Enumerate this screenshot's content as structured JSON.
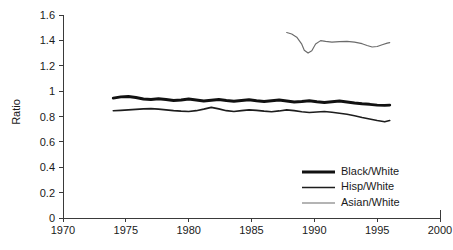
{
  "chart_data": {
    "type": "line",
    "title": "",
    "xlabel": "",
    "ylabel": "Ratio",
    "xlim": [
      1970,
      2000
    ],
    "ylim": [
      0,
      1.6
    ],
    "grid": false,
    "legend_position": "bottom-right",
    "x_ticks": [
      "1970",
      "1975",
      "1980",
      "1985",
      "1990",
      "1995",
      "2000"
    ],
    "y_ticks": [
      "0",
      "0.2",
      "0.4",
      "0.6",
      "0.8",
      "1",
      "1.2",
      "1.4",
      "1.6"
    ],
    "series": [
      {
        "name": "Black/White",
        "color": "#111111",
        "width": 2.9,
        "x": [
          1974.0,
          1974.6,
          1975.2,
          1975.8,
          1976.4,
          1977.0,
          1977.6,
          1978.2,
          1978.8,
          1979.4,
          1980.0,
          1980.6,
          1981.2,
          1981.8,
          1982.4,
          1983.0,
          1983.6,
          1984.2,
          1984.8,
          1985.4,
          1986.0,
          1986.6,
          1987.2,
          1987.8,
          1988.4,
          1989.0,
          1989.6,
          1990.2,
          1990.8,
          1991.4,
          1992.0,
          1992.6,
          1993.2,
          1993.8,
          1994.4,
          1995.0,
          1995.6,
          1996.0
        ],
        "values": [
          0.945,
          0.955,
          0.958,
          0.95,
          0.938,
          0.934,
          0.94,
          0.934,
          0.926,
          0.93,
          0.938,
          0.93,
          0.922,
          0.928,
          0.934,
          0.926,
          0.92,
          0.926,
          0.932,
          0.924,
          0.918,
          0.924,
          0.93,
          0.922,
          0.914,
          0.918,
          0.924,
          0.916,
          0.91,
          0.916,
          0.922,
          0.914,
          0.906,
          0.9,
          0.896,
          0.89,
          0.888,
          0.89
        ]
      },
      {
        "name": "Hisp/White",
        "color": "#1d1d1d",
        "width": 1.6,
        "x": [
          1974.0,
          1974.6,
          1975.2,
          1975.8,
          1976.4,
          1977.0,
          1977.6,
          1978.2,
          1978.8,
          1979.4,
          1980.0,
          1980.6,
          1981.2,
          1981.8,
          1982.4,
          1983.0,
          1983.6,
          1984.2,
          1984.8,
          1985.4,
          1986.0,
          1986.6,
          1987.2,
          1987.8,
          1988.4,
          1989.0,
          1989.6,
          1990.2,
          1990.8,
          1991.4,
          1992.0,
          1992.6,
          1993.2,
          1993.8,
          1994.4,
          1995.0,
          1995.6,
          1996.0
        ],
        "values": [
          0.845,
          0.848,
          0.852,
          0.856,
          0.86,
          0.862,
          0.858,
          0.852,
          0.846,
          0.842,
          0.84,
          0.846,
          0.858,
          0.872,
          0.86,
          0.846,
          0.84,
          0.846,
          0.852,
          0.848,
          0.842,
          0.838,
          0.844,
          0.852,
          0.846,
          0.838,
          0.832,
          0.836,
          0.84,
          0.834,
          0.826,
          0.818,
          0.806,
          0.792,
          0.78,
          0.768,
          0.758,
          0.768
        ]
      },
      {
        "name": "Asian/White",
        "color": "#6b6b6b",
        "width": 1.15,
        "x": [
          1987.8,
          1988.2,
          1988.6,
          1989.0,
          1989.2,
          1989.5,
          1989.8,
          1990.1,
          1990.5,
          1990.9,
          1991.4,
          1992.0,
          1992.6,
          1993.2,
          1993.8,
          1994.2,
          1994.6,
          1995.0,
          1995.4,
          1995.8,
          1996.0
        ],
        "values": [
          1.462,
          1.45,
          1.425,
          1.37,
          1.322,
          1.3,
          1.318,
          1.372,
          1.398,
          1.392,
          1.386,
          1.39,
          1.392,
          1.386,
          1.374,
          1.36,
          1.348,
          1.352,
          1.366,
          1.378,
          1.382
        ]
      }
    ]
  },
  "legend": {
    "items": [
      {
        "label": "Black/White"
      },
      {
        "label": "Hisp/White"
      },
      {
        "label": "Asian/White"
      }
    ]
  }
}
